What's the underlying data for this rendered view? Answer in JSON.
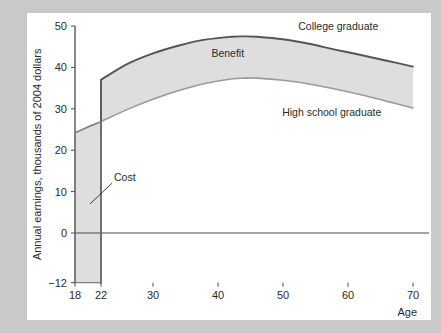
{
  "figure": {
    "background_color": "#c9c9c9",
    "panel_color": "#ffffff"
  },
  "chart_data": {
    "type": "area",
    "title": "",
    "subtitle": "",
    "xlabel": "Age",
    "ylabel": "Annual earnings, thousands of 2004 dollars",
    "xlim": [
      18,
      70
    ],
    "ylim": [
      -12,
      50
    ],
    "xticks": [
      18,
      22,
      30,
      40,
      50,
      60,
      70
    ],
    "xtick_labels": [
      "18",
      "22",
      "30",
      "40",
      "50",
      "60",
      "70"
    ],
    "yticks": [
      -12,
      0,
      10,
      20,
      30,
      40,
      50
    ],
    "ytick_labels": [
      "−12",
      "0",
      "10",
      "20",
      "30",
      "40",
      "50"
    ],
    "grid": false,
    "legend_position": "inline-annotations",
    "zero_line": 0,
    "series": [
      {
        "name": "College graduate",
        "color": "#555555",
        "x": [
          18,
          20,
          22,
          22,
          26,
          30,
          34,
          38,
          42,
          44,
          46,
          50,
          54,
          58,
          62,
          66,
          70
        ],
        "values": [
          -12,
          -12,
          -12,
          37.0,
          40.8,
          43.4,
          45.3,
          46.7,
          47.4,
          47.5,
          47.4,
          46.8,
          45.7,
          44.3,
          43.0,
          41.6,
          40.2
        ]
      },
      {
        "name": "High school graduate",
        "color": "#9a9a9a",
        "x": [
          18,
          20,
          22,
          26,
          30,
          34,
          38,
          42,
          44,
          46,
          50,
          54,
          58,
          62,
          66,
          70
        ],
        "values": [
          24.2,
          25.6,
          26.9,
          29.8,
          32.3,
          34.4,
          36.1,
          37.2,
          37.4,
          37.4,
          36.9,
          36.0,
          34.8,
          33.4,
          31.8,
          30.2
        ]
      }
    ],
    "bands": [
      {
        "name": "Benefit",
        "label": "Benefit",
        "fill": "#dedede",
        "upper_series": "College graduate",
        "lower_series": "High school graduate",
        "x_range": [
          22,
          70
        ]
      },
      {
        "name": "Cost",
        "label": "Cost",
        "fill": "#dedede",
        "upper_series": "High school graduate",
        "lower_value": -12,
        "x_range": [
          18,
          22
        ]
      }
    ],
    "annotations": [
      {
        "name": "college-graduate-label",
        "text": "College graduate",
        "x": 58.5,
        "y": 49.0
      },
      {
        "name": "high-school-graduate-label",
        "text": "High school graduate",
        "x": 57.5,
        "y": 28.2
      },
      {
        "name": "benefit-label",
        "text": "Benefit",
        "x": 41.5,
        "y": 42.5
      },
      {
        "name": "cost-label",
        "text": "Cost",
        "x": 24.0,
        "y": 12.5,
        "leader_to_x": 20.3,
        "leader_to_y": 7.0
      }
    ]
  }
}
